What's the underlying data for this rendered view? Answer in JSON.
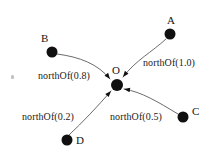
{
  "figure": {
    "type": "directed-graph",
    "background_color": "#ffffff",
    "ink_color": "#101010",
    "edge_color": "#5a5a5a"
  },
  "nodes": [
    {
      "id": "A",
      "label": "A",
      "cx": 170,
      "cy": 34,
      "r": 5.5,
      "label_x": 167,
      "label_y": 15
    },
    {
      "id": "B",
      "label": "B",
      "cx": 52,
      "cy": 52,
      "r": 5.5,
      "label_x": 41,
      "label_y": 33
    },
    {
      "id": "C",
      "label": "C",
      "cx": 183,
      "cy": 117,
      "r": 5.5,
      "label_x": 192,
      "label_y": 106
    },
    {
      "id": "D",
      "label": "D",
      "cx": 67,
      "cy": 140,
      "r": 5.5,
      "label_x": 76,
      "label_y": 135
    },
    {
      "id": "O",
      "label": "O",
      "cx": 117,
      "cy": 85,
      "r": 6.0,
      "label_x": 112,
      "label_y": 65
    }
  ],
  "edges": [
    {
      "id": "a-to-o",
      "source": "A",
      "target": "O",
      "relation": "northOf",
      "weight": "1.0",
      "label": "northOf(1.0)",
      "label_x": 143,
      "label_y": 58,
      "path": "M 166 39 C 152 52 136 60 123 77",
      "arrow_angle": 128
    },
    {
      "id": "b-to-o",
      "source": "B",
      "target": "O",
      "relation": "northOf",
      "weight": "0.8",
      "label": "northOf(0.8)",
      "label_x": 38,
      "label_y": 71,
      "path": "M 57 54 C 80 57 98 64 110 79",
      "arrow_angle": 52
    },
    {
      "id": "c-to-o",
      "source": "C",
      "target": "O",
      "relation": "northOf",
      "weight": "0.5",
      "label": "northOf(0.5)",
      "label_x": 110,
      "label_y": 112,
      "path": "M 178 114 C 158 102 142 92 124 89",
      "arrow_angle": 190
    },
    {
      "id": "d-to-o",
      "source": "D",
      "target": "O",
      "relation": "northOf",
      "weight": "0.2",
      "label": "northOf(0.2)",
      "label_x": 22,
      "label_y": 112,
      "path": "M 69 135 C 83 122 97 107 111 91",
      "arrow_angle": 312
    }
  ],
  "artifacts": [
    {
      "id": "speck-left",
      "x": 11,
      "y": 75
    }
  ]
}
